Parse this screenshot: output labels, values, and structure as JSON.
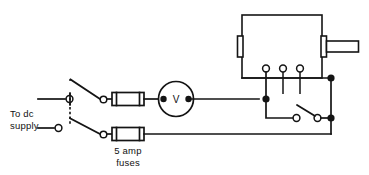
{
  "diagram": {
    "background_color": "#ffffff",
    "line_color": "#141414",
    "width": 369,
    "height": 175
  },
  "labels": {
    "supply_line1": "To dc",
    "supply_line2": "supply",
    "fuse_line1": "5 amp",
    "fuse_line2": "fuses",
    "meter_symbol": "V"
  },
  "components": {
    "voltmeter": {
      "name": "voltmeter",
      "symbol": "V",
      "terminals": 2
    },
    "fuses": {
      "name": "fuses",
      "rating": "5 amp",
      "count": 2
    },
    "supply_terminals": {
      "name": "dc-supply-terminals",
      "count": 2
    },
    "double_pole_switch": {
      "name": "double-pole-switch",
      "poles": 2,
      "state": "open"
    },
    "single_pole_switch": {
      "name": "single-pole-switch",
      "poles": 1,
      "state": "open"
    },
    "enclosure": {
      "name": "instrument-enclosure",
      "terminals": 3,
      "has_shaft": true,
      "has_side_tab": true
    }
  }
}
